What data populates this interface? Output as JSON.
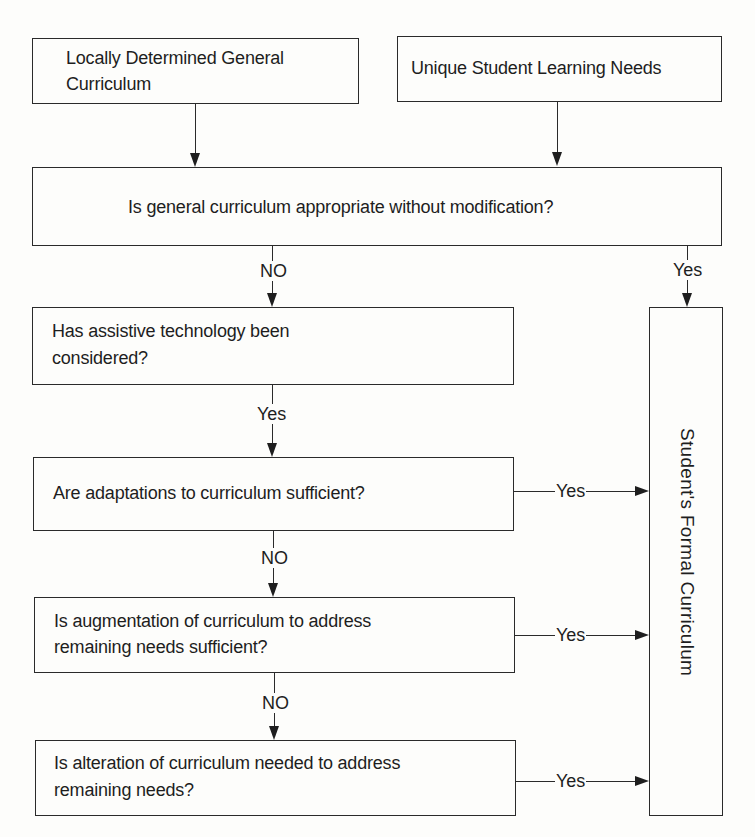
{
  "diagram": {
    "type": "flowchart",
    "nodes": {
      "general_curriculum": "Locally Determined General Curriculum",
      "general_curriculum_l1": "Locally Determined General",
      "general_curriculum_l2": "Curriculum",
      "student_needs": "Unique Student Learning Needs",
      "q_appropriate": "Is general curriculum appropriate without modification?",
      "q_assistive_l1": "Has assistive technology been",
      "q_assistive_l2": "considered?",
      "q_adaptations": "Are adaptations to curriculum sufficient?",
      "q_augmentation_l1": "Is augmentation of curriculum to address",
      "q_augmentation_l2": "remaining needs sufficient?",
      "q_alteration_l1": "Is alteration of curriculum needed to address",
      "q_alteration_l2": "remaining needs?",
      "formal_curriculum": "Student's Formal Curriculum"
    },
    "edges": {
      "appropriate_no": "NO",
      "appropriate_yes": "Yes",
      "assistive_yes": "Yes",
      "adaptations_no": "NO",
      "adaptations_yes": "Yes",
      "augmentation_no": "NO",
      "augmentation_yes": "Yes",
      "alteration_yes": "Yes"
    }
  }
}
